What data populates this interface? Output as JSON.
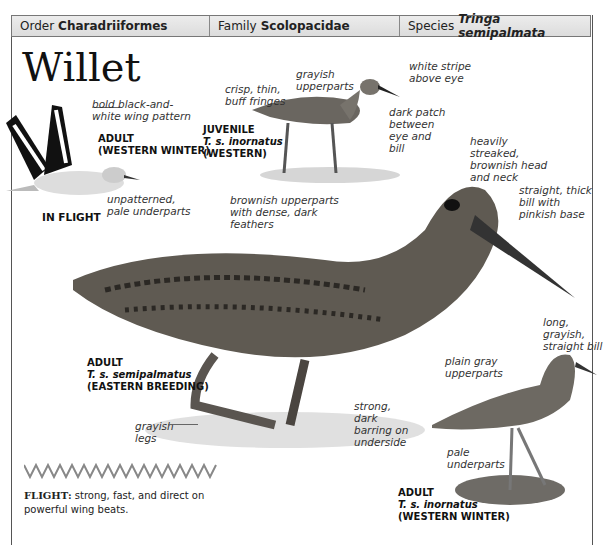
{
  "header": {
    "order_label": "Order",
    "order_value": "Charadriiformes",
    "family_label": "Family",
    "family_value": "Scolopacidae",
    "species_label": "Species",
    "species_value": "Tringa semipalmata"
  },
  "title": "Willet",
  "in_flight": {
    "label": "IN FLIGHT",
    "age": "ADULT",
    "season": "(WESTERN WINTER)",
    "notes": [
      "bold black-and-white wing pattern",
      "unpatterned, pale underparts"
    ]
  },
  "juvenile": {
    "age": "JUVENILE",
    "subspecies": "T. s. inornatus",
    "region": "(WESTERN)",
    "notes": {
      "fringes": "crisp, thin, buff fringes",
      "upperparts": "grayish upperparts",
      "stripe": "white stripe above eye",
      "patch": "dark patch between eye and bill"
    }
  },
  "eastern": {
    "age": "ADULT",
    "subspecies": "T. s. semipalmatus",
    "season": "(EASTERN BREEDING)",
    "notes": {
      "head": "heavily streaked, brownish head and neck",
      "bill": "straight, thick bill with pinkish base",
      "upperparts": "brownish upperparts with dense, dark feathers",
      "underside": "strong, dark barring on underside",
      "legs": "grayish legs"
    }
  },
  "western_winter": {
    "age": "ADULT",
    "subspecies": "T. s. inornatus",
    "season": "(WESTERN WINTER)",
    "notes": {
      "bill": "long, grayish, straight bill",
      "upperparts": "plain gray upperparts",
      "underparts": "pale underparts"
    }
  },
  "flight": {
    "label": "FLIGHT:",
    "text": "strong, fast, and direct on powerful wing beats."
  }
}
